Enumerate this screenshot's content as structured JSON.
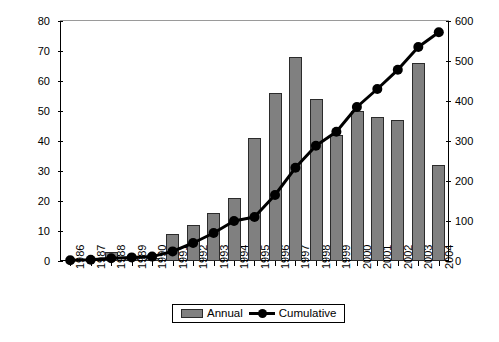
{
  "chart_data": {
    "type": "bar",
    "title": "",
    "subtitle": "",
    "xlabel": "",
    "ylabel": "",
    "categories": [
      "1986",
      "1987",
      "1988",
      "1989",
      "1990",
      "1991",
      "1992",
      "1993",
      "1994",
      "1995",
      "1996",
      "1997",
      "1998",
      "1999",
      "2000",
      "2001",
      "2002",
      "2003",
      "2004"
    ],
    "series": [
      {
        "name": "Annual",
        "type": "bar",
        "axis": "left",
        "color": "#808080",
        "values": [
          0,
          0,
          3,
          1,
          1,
          9,
          12,
          16,
          21,
          41,
          56,
          68,
          54,
          42,
          50,
          48,
          47,
          66,
          32
        ]
      },
      {
        "name": "Cumulative",
        "type": "line",
        "axis": "right",
        "color": "#000000",
        "values": [
          2,
          3,
          7,
          9,
          11,
          24,
          45,
          70,
          100,
          110,
          165,
          233,
          288,
          323,
          385,
          430,
          478,
          535,
          572
        ]
      }
    ],
    "left_axis": {
      "min": 0,
      "max": 80,
      "step": 10,
      "ticks": [
        "0",
        "10",
        "20",
        "30",
        "40",
        "50",
        "60",
        "70",
        "80"
      ]
    },
    "right_axis": {
      "min": 0,
      "max": 600,
      "step": 100,
      "ticks": [
        "0",
        "100",
        "200",
        "300",
        "400",
        "500",
        "600"
      ]
    },
    "grid": false,
    "legend": {
      "position": "bottom",
      "entries": [
        {
          "label": "Annual",
          "marker": "bar-swatch",
          "color": "#808080"
        },
        {
          "label": "Cumulative",
          "marker": "line-dot",
          "color": "#000000"
        }
      ]
    }
  }
}
